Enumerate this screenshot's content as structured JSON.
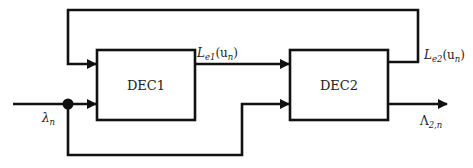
{
  "diagram": {
    "type": "block-diagram",
    "blocks": [
      {
        "id": "dec1",
        "label": "DEC1"
      },
      {
        "id": "dec2",
        "label": "DEC2"
      }
    ],
    "signals": {
      "input": {
        "symbol": "λ",
        "sub": "n"
      },
      "le1": {
        "symbol": "L",
        "sub": "e1",
        "arg": "(u",
        "arg_sub": "n",
        "close": ")"
      },
      "le2": {
        "symbol": "L",
        "sub": "e2",
        "arg": "(u",
        "arg_sub": "n",
        "close": ")"
      },
      "output": {
        "symbol": "Λ",
        "sub": "2,n"
      }
    },
    "connections": [
      {
        "from": "input",
        "to": "dec1"
      },
      {
        "from": "input",
        "to": "dec2",
        "via": "lower loop"
      },
      {
        "from": "dec1",
        "to": "dec2",
        "label": "L_e1(u_n)"
      },
      {
        "from": "dec2",
        "to": "dec1",
        "label": "L_e2(u_n)",
        "via": "top feedback"
      },
      {
        "from": "dec2",
        "to": "output",
        "label": "Λ_2,n"
      }
    ],
    "colors": {
      "stroke": "#111111",
      "text": "#222222",
      "background": "#ffffff"
    }
  }
}
